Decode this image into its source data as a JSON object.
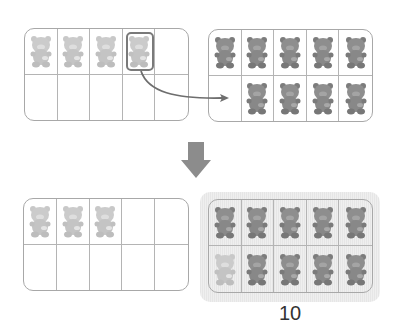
{
  "diagram": {
    "top_left_frame": {
      "filled": 4,
      "bear_shade": "light",
      "selected_index": 3
    },
    "top_right_frame": {
      "filled": 9,
      "bear_shade": "dark",
      "empty_index": 5
    },
    "transition_arrow": "down-arrow",
    "bottom_left_frame": {
      "filled": 3,
      "bear_shade": "light"
    },
    "bottom_right_frame": {
      "filled": 10,
      "bear_shade": "dark",
      "moved_bear_index": 5,
      "highlighted": true
    },
    "result_label": "10",
    "colors": {
      "frame_border": "#a8a8a8",
      "light_bear": "#c4c4c4",
      "dark_bear": "#8a8a8a",
      "arrow": "#8c8c8c",
      "highlight": "#e9e9e9"
    }
  }
}
